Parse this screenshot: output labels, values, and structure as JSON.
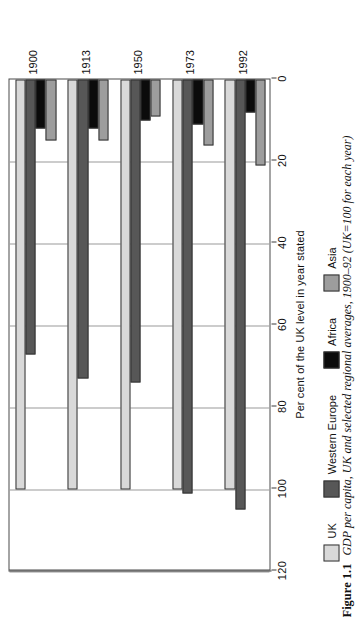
{
  "figure": {
    "number": "Figure 1.1",
    "caption": "GDP per capita, UK and selected regional averages, 1900–92 (UK=100 for each year)"
  },
  "chart_data": {
    "type": "bar",
    "orientation": "vertical-rotated",
    "title": "",
    "xlabel": "",
    "ylabel": "Per cent of the UK level in year stated",
    "ylim": [
      0,
      120
    ],
    "yticks": [
      0,
      20,
      40,
      60,
      80,
      100,
      120
    ],
    "ytick_labels": [
      "0",
      "20",
      "40",
      "60",
      "80",
      "100",
      "120"
    ],
    "grid": true,
    "legend_position": "bottom",
    "categories": [
      "1900",
      "1913",
      "1950",
      "1973",
      "1992"
    ],
    "series": [
      {
        "name": "UK",
        "color": "#d9d9d9",
        "values": [
          100,
          100,
          100,
          100,
          100
        ]
      },
      {
        "name": "Western Europe",
        "color": "#575757",
        "values": [
          67,
          73,
          74,
          101,
          105
        ]
      },
      {
        "name": "Africa",
        "color": "#0b0b0b",
        "values": [
          12,
          12,
          10,
          11,
          8
        ]
      },
      {
        "name": "Asia",
        "color": "#9d9d9d",
        "values": [
          15,
          15,
          9,
          16,
          21
        ]
      }
    ]
  }
}
